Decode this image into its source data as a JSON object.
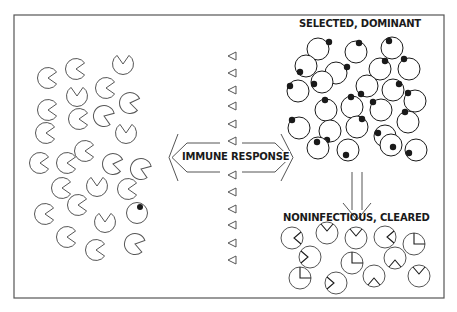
{
  "diagram": {
    "frame": {
      "x": 14,
      "y": 15,
      "w": 430,
      "h": 283,
      "stroke": "#555555"
    },
    "labels": {
      "selected": "SELECTED, DOMINANT",
      "immune": "IMMUNE RESPONSE",
      "cleared": "NONINFECTIOUS, CLEARED"
    },
    "colors": {
      "ink": "#1a1a1a",
      "line": "#555555",
      "background": "#ffffff"
    },
    "left_population": {
      "description": "Diverse virus variants (pac-man shapes with wedge notches), one variant with dark spot",
      "items": [
        {
          "x": 48,
          "y": 78,
          "angle": 0
        },
        {
          "x": 76,
          "y": 69,
          "angle": 0
        },
        {
          "x": 123,
          "y": 64,
          "angle": -90
        },
        {
          "x": 77,
          "y": 96,
          "angle": -90
        },
        {
          "x": 106,
          "y": 88,
          "angle": 0
        },
        {
          "x": 130,
          "y": 103,
          "angle": 10
        },
        {
          "x": 48,
          "y": 110,
          "angle": 0
        },
        {
          "x": 79,
          "y": 119,
          "angle": 0
        },
        {
          "x": 104,
          "y": 116,
          "angle": 20
        },
        {
          "x": 46,
          "y": 133,
          "angle": 0
        },
        {
          "x": 126,
          "y": 133,
          "angle": -90
        },
        {
          "x": 85,
          "y": 151,
          "angle": 0
        },
        {
          "x": 40,
          "y": 163,
          "angle": 0
        },
        {
          "x": 67,
          "y": 163,
          "angle": 0
        },
        {
          "x": 113,
          "y": 164,
          "angle": 10
        },
        {
          "x": 141,
          "y": 169,
          "angle": 20
        },
        {
          "x": 62,
          "y": 188,
          "angle": 0
        },
        {
          "x": 97,
          "y": 186,
          "angle": -90
        },
        {
          "x": 128,
          "y": 189,
          "angle": 0
        },
        {
          "x": 45,
          "y": 214,
          "angle": 0
        },
        {
          "x": 78,
          "y": 205,
          "angle": 0
        },
        {
          "x": 105,
          "y": 222,
          "angle": -90
        },
        {
          "x": 67,
          "y": 237,
          "angle": 0
        },
        {
          "x": 96,
          "y": 250,
          "angle": 0
        },
        {
          "x": 135,
          "y": 244,
          "angle": 15
        }
      ],
      "spotted": {
        "x": 137,
        "y": 213
      }
    },
    "antibodies": {
      "x": 232,
      "ys": [
        56,
        73,
        90,
        106,
        124,
        141,
        175,
        192,
        209,
        225,
        243,
        260
      ]
    },
    "right_dominant": {
      "circles": [
        {
          "x": 318,
          "y": 49,
          "sx": 329,
          "sy": 42
        },
        {
          "x": 356,
          "y": 52,
          "sx": 359,
          "sy": 43
        },
        {
          "x": 392,
          "y": 48,
          "sx": 389,
          "sy": 41
        },
        {
          "x": 306,
          "y": 66,
          "sx": 300,
          "sy": 72
        },
        {
          "x": 380,
          "y": 69,
          "sx": 385,
          "sy": 61
        },
        {
          "x": 409,
          "y": 69,
          "sx": 404,
          "sy": 59
        },
        {
          "x": 336,
          "y": 73,
          "sx": 347,
          "sy": 67
        },
        {
          "x": 298,
          "y": 91,
          "sx": 290,
          "sy": 86
        },
        {
          "x": 322,
          "y": 82,
          "sx": 314,
          "sy": 84
        },
        {
          "x": 367,
          "y": 86,
          "sx": 361,
          "sy": 94
        },
        {
          "x": 393,
          "y": 90,
          "sx": 399,
          "sy": 84
        },
        {
          "x": 415,
          "y": 101,
          "sx": 408,
          "sy": 93
        },
        {
          "x": 326,
          "y": 110,
          "sx": 325,
          "sy": 100
        },
        {
          "x": 352,
          "y": 107,
          "sx": 351,
          "sy": 97
        },
        {
          "x": 381,
          "y": 110,
          "sx": 373,
          "sy": 102
        },
        {
          "x": 408,
          "y": 122,
          "sx": 405,
          "sy": 112
        },
        {
          "x": 299,
          "y": 128,
          "sx": 292,
          "sy": 120
        },
        {
          "x": 330,
          "y": 131,
          "sx": 327,
          "sy": 140
        },
        {
          "x": 357,
          "y": 127,
          "sx": 362,
          "sy": 119
        },
        {
          "x": 385,
          "y": 136,
          "sx": 378,
          "sy": 133
        },
        {
          "x": 318,
          "y": 148,
          "sx": 317,
          "sy": 142
        },
        {
          "x": 348,
          "y": 150,
          "sx": 346,
          "sy": 155
        },
        {
          "x": 391,
          "y": 145,
          "sx": 393,
          "sy": 147
        },
        {
          "x": 416,
          "y": 150,
          "sx": 409,
          "sy": 153
        }
      ]
    },
    "right_cleared": {
      "circles": [
        {
          "x": 292,
          "y": 238,
          "notch": "right"
        },
        {
          "x": 327,
          "y": 233,
          "notch": "top"
        },
        {
          "x": 356,
          "y": 238,
          "notch": "top"
        },
        {
          "x": 385,
          "y": 237,
          "notch": "right"
        },
        {
          "x": 414,
          "y": 244,
          "notch": "corner"
        },
        {
          "x": 310,
          "y": 257,
          "notch": "left"
        },
        {
          "x": 352,
          "y": 263,
          "notch": "corner"
        },
        {
          "x": 395,
          "y": 258,
          "notch": "bottom"
        },
        {
          "x": 300,
          "y": 278,
          "notch": "corner"
        },
        {
          "x": 336,
          "y": 283,
          "notch": "left"
        },
        {
          "x": 374,
          "y": 276,
          "notch": "bottom"
        },
        {
          "x": 419,
          "y": 276,
          "notch": "top"
        }
      ]
    }
  }
}
